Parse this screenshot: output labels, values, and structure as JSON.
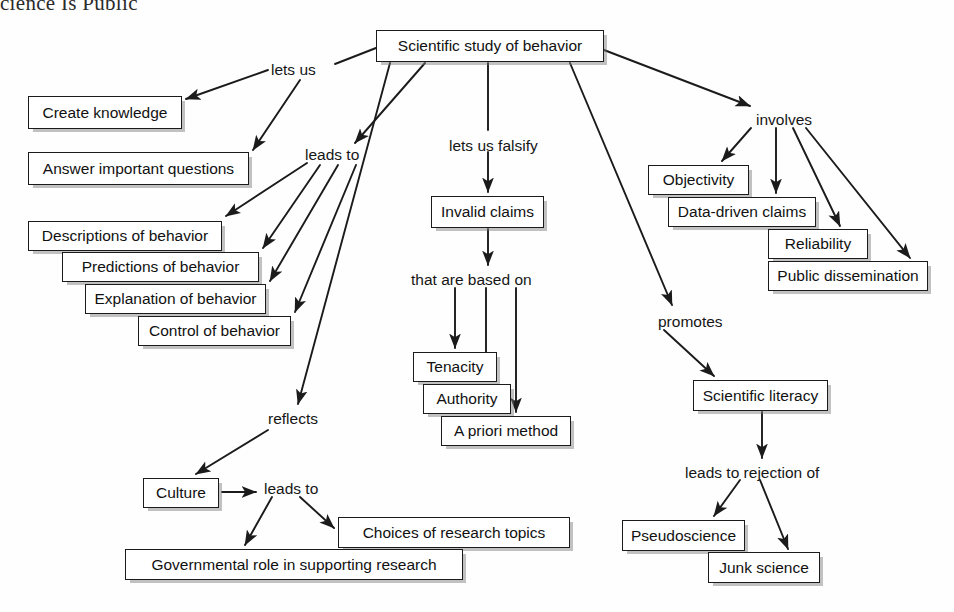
{
  "header": {
    "title": "cience Is Public"
  },
  "diagram": {
    "type": "concept-map",
    "root": "Scientific study of behavior",
    "nodes": [
      {
        "id": "root",
        "label": "Scientific study of behavior",
        "x": 376,
        "y": 30,
        "w": 228,
        "h": 32
      },
      {
        "id": "create",
        "label": "Create knowledge",
        "x": 28,
        "y": 96,
        "w": 154,
        "h": 33
      },
      {
        "id": "answer",
        "label": "Answer important questions",
        "x": 28,
        "y": 152,
        "w": 221,
        "h": 33
      },
      {
        "id": "descr",
        "label": "Descriptions of behavior",
        "x": 28,
        "y": 221,
        "w": 194,
        "h": 30
      },
      {
        "id": "pred",
        "label": "Predictions of behavior",
        "x": 62,
        "y": 252,
        "w": 197,
        "h": 30
      },
      {
        "id": "expl",
        "label": "Explanation of behavior",
        "x": 85,
        "y": 284,
        "w": 181,
        "h": 30
      },
      {
        "id": "ctrl",
        "label": "Control of behavior",
        "x": 138,
        "y": 316,
        "w": 153,
        "h": 30
      },
      {
        "id": "invalid",
        "label": "Invalid claims",
        "x": 431,
        "y": 196,
        "w": 113,
        "h": 32
      },
      {
        "id": "tenacity",
        "label": "Tenacity",
        "x": 413,
        "y": 352,
        "w": 84,
        "h": 30
      },
      {
        "id": "authority",
        "label": "Authority",
        "x": 423,
        "y": 384,
        "w": 88,
        "h": 30
      },
      {
        "id": "apriori",
        "label": "A priori method",
        "x": 441,
        "y": 416,
        "w": 130,
        "h": 30
      },
      {
        "id": "objectivity",
        "label": "Objectivity",
        "x": 648,
        "y": 165,
        "w": 101,
        "h": 30
      },
      {
        "id": "datadriven",
        "label": "Data-driven claims",
        "x": 668,
        "y": 197,
        "w": 148,
        "h": 30
      },
      {
        "id": "reliability",
        "label": "Reliability",
        "x": 768,
        "y": 229,
        "w": 100,
        "h": 30
      },
      {
        "id": "public",
        "label": "Public dissemination",
        "x": 768,
        "y": 261,
        "w": 160,
        "h": 30
      },
      {
        "id": "literacy",
        "label": "Scientific literacy",
        "x": 693,
        "y": 380,
        "w": 135,
        "h": 31
      },
      {
        "id": "pseudo",
        "label": "Pseudoscience",
        "x": 622,
        "y": 520,
        "w": 123,
        "h": 31
      },
      {
        "id": "junk",
        "label": "Junk science",
        "x": 708,
        "y": 552,
        "w": 112,
        "h": 31
      },
      {
        "id": "culture",
        "label": "Culture",
        "x": 143,
        "y": 478,
        "w": 76,
        "h": 30
      },
      {
        "id": "choices",
        "label": "Choices of research topics",
        "x": 338,
        "y": 517,
        "w": 232,
        "h": 31
      },
      {
        "id": "govrole",
        "label": "Governmental role in supporting research",
        "x": 125,
        "y": 549,
        "w": 338,
        "h": 31
      }
    ],
    "link_labels": [
      {
        "id": "letsus",
        "label": "lets us",
        "x": 271,
        "y": 62
      },
      {
        "id": "leadsto1",
        "label": "leads to",
        "x": 305,
        "y": 147
      },
      {
        "id": "falsify",
        "label": "lets us falsify",
        "x": 449,
        "y": 138
      },
      {
        "id": "basedon",
        "label": "that are based on",
        "x": 411,
        "y": 272
      },
      {
        "id": "involves",
        "label": "involves",
        "x": 756,
        "y": 112
      },
      {
        "id": "promotes",
        "label": "promotes",
        "x": 658,
        "y": 314
      },
      {
        "id": "rejection",
        "label": "leads to rejection of",
        "x": 685,
        "y": 465
      },
      {
        "id": "reflects",
        "label": "reflects",
        "x": 268,
        "y": 411
      },
      {
        "id": "leadsto2",
        "label": "leads to",
        "x": 264,
        "y": 481
      }
    ],
    "edges": [
      {
        "from": "root",
        "to": "letsus",
        "path": "M 376 48 L 335 64",
        "arrow": false
      },
      {
        "from": "letsus",
        "to": "create",
        "path": "M 268 70 L 186 99",
        "arrow": true
      },
      {
        "from": "letsus",
        "to": "answer",
        "path": "M 300 80 L 253 150",
        "arrow": true
      },
      {
        "from": "root",
        "to": "leadsto1",
        "path": "M 425 63 L 355 143",
        "arrow": true
      },
      {
        "from": "leadsto1",
        "to": "descr",
        "path": "M 307 163 L 226 216",
        "arrow": true
      },
      {
        "from": "leadsto1",
        "to": "pred",
        "path": "M 320 165 L 263 248",
        "arrow": true
      },
      {
        "from": "leadsto1",
        "to": "expl",
        "path": "M 338 165 L 270 281",
        "arrow": true
      },
      {
        "from": "leadsto1",
        "to": "ctrl",
        "path": "M 356 165 L 295 312",
        "arrow": true
      },
      {
        "from": "root",
        "to": "falsify",
        "path": "M 488 63 L 488 130",
        "arrow": false
      },
      {
        "from": "falsify",
        "to": "invalid",
        "path": "M 488 152 L 488 192",
        "arrow": true
      },
      {
        "from": "invalid",
        "to": "basedon",
        "path": "M 488 229 L 488 265",
        "arrow": true
      },
      {
        "from": "basedon",
        "to": "tenacity",
        "path": "M 455 288 L 455 348",
        "arrow": true
      },
      {
        "from": "basedon",
        "to": "authority",
        "path": "M 486 288 L 486 380",
        "arrow": true
      },
      {
        "from": "basedon",
        "to": "apriori",
        "path": "M 516 288 L 516 412",
        "arrow": true
      },
      {
        "from": "root",
        "to": "involves",
        "path": "M 604 50 L 750 106",
        "arrow": true
      },
      {
        "from": "involves",
        "to": "objectivity",
        "path": "M 751 128 L 722 161",
        "arrow": true
      },
      {
        "from": "involves",
        "to": "datadriven",
        "path": "M 776 128 L 776 193",
        "arrow": true
      },
      {
        "from": "involves",
        "to": "reliability",
        "path": "M 793 128 L 840 226",
        "arrow": true
      },
      {
        "from": "involves",
        "to": "public",
        "path": "M 806 128 L 910 258",
        "arrow": true
      },
      {
        "from": "root",
        "to": "promotes",
        "path": "M 570 63 L 672 305",
        "arrow": true
      },
      {
        "from": "promotes",
        "to": "literacy",
        "path": "M 664 330 L 714 376",
        "arrow": true
      },
      {
        "from": "literacy",
        "to": "rejection",
        "path": "M 762 412 L 762 458",
        "arrow": true
      },
      {
        "from": "rejection",
        "to": "pseudo",
        "path": "M 740 480 L 714 516",
        "arrow": true
      },
      {
        "from": "rejection",
        "to": "junk",
        "path": "M 760 480 L 788 549",
        "arrow": true
      },
      {
        "from": "root",
        "to": "reflects",
        "path": "M 390 63 L 298 404",
        "arrow": true
      },
      {
        "from": "reflects",
        "to": "culture",
        "path": "M 268 430 L 196 474",
        "arrow": true
      },
      {
        "from": "culture",
        "to": "leadsto2",
        "path": "M 222 492 L 256 492",
        "arrow": true
      },
      {
        "from": "leadsto2",
        "to": "govrole",
        "path": "M 272 497 L 245 545",
        "arrow": true
      },
      {
        "from": "leadsto2",
        "to": "choices",
        "path": "M 300 497 L 334 528",
        "arrow": true
      }
    ]
  }
}
